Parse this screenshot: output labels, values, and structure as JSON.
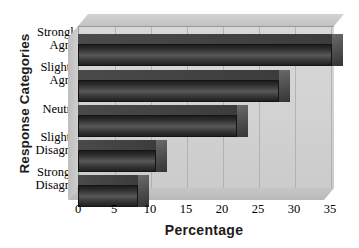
{
  "chart_data": {
    "type": "bar",
    "orientation": "horizontal",
    "title": "",
    "xlabel": "Percentage",
    "ylabel": "Response Categories",
    "categories": [
      "Strongly Agree",
      "Slightly Agree",
      "Neutral",
      "Slightly Disagree",
      "Strongly Disagree"
    ],
    "category_lines": [
      [
        "Strongly",
        "Agree"
      ],
      [
        "Slightly",
        "Agree"
      ],
      [
        "Neutral"
      ],
      [
        "Slightly",
        "Disagree"
      ],
      [
        "Strongly",
        "Disagree"
      ]
    ],
    "values": [
      36,
      28.5,
      22.5,
      11,
      8.5
    ],
    "xlim": [
      0,
      35
    ],
    "xticks": [
      0,
      5,
      10,
      15,
      20,
      25,
      30,
      35
    ],
    "xtick_labels": [
      "0",
      "5",
      "10",
      "15",
      "20",
      "25",
      "30",
      "35"
    ],
    "grid": "vertical",
    "legend": "none",
    "style": "3d-bar",
    "colors": {
      "bar_face": "#2c2c2c",
      "bar_highlight": "#585858",
      "bar_top": "#4a4a4a",
      "panel_back": "#d4d4d4",
      "panel_floor": "#c0c0c0",
      "gridline": "#a8a8a8",
      "text": "#000000",
      "background": "#ffffff"
    }
  }
}
